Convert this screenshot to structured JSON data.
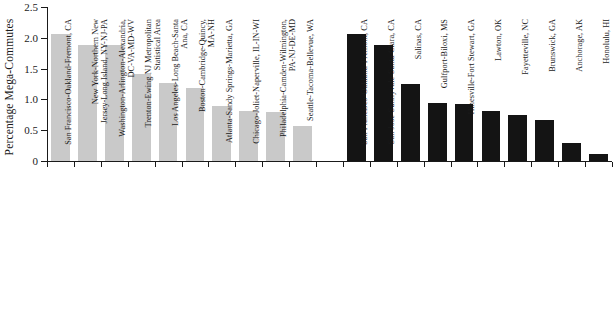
{
  "chart_data": {
    "type": "bar",
    "title": "",
    "xlabel": "",
    "ylabel": "Percentage Mega-Commutes",
    "ylim": [
      0,
      2.5
    ],
    "yticks": [
      "0",
      "0.5",
      "1.0",
      "1.5",
      "2.0",
      "2.5"
    ],
    "ytick_values": [
      0,
      0.5,
      1.0,
      1.5,
      2.0,
      2.5
    ],
    "grid": false,
    "legend": "none",
    "groups": [
      {
        "name": "largest-metros",
        "color": "#c9c9c9",
        "categories": [
          "San Francisco-Oakland-Fremont, CA",
          "New York-Northern New\nJersey-Long Island, NY-NJ-PA",
          "Washington-Arlington-Alexandria,\nDC-VA-MD-WV",
          "Trenton-Ewing NJ Metropolitan\nStatistical Area",
          "Los Angeles-Long Beach-Santa\nAna, CA",
          "Boston-Cambridge-Quincy,\nMA-NH",
          "Atlanta-Sandy Springs-Marietta, GA",
          "Chicago-Joliet-Naperville, IL-IN-WI",
          "Philadelphia-Camden-Wilmington,\nPA-NJ-DE-MD",
          "Seattle-Tacoma-Bellevue, WA"
        ],
        "values": [
          2.06,
          1.89,
          1.88,
          1.41,
          1.26,
          1.18,
          0.9,
          0.81,
          0.8,
          0.57
        ]
      },
      {
        "name": "highest-and-lowest-rates",
        "color": "#141414",
        "categories": [
          "San Francisco-Oakland-Fremont, CA",
          "San Jose-Sunnyvale-Santa Clara, CA",
          "Salinas, CA",
          "Gulfport-Biloxi, MS",
          "Hinesville-Fort Stewart, GA",
          "Lawton, OK",
          "Fayetteville, NC",
          "Brunswick, GA",
          "Anchorage, AK",
          "Honolulu, HI"
        ],
        "values": [
          2.06,
          1.89,
          1.25,
          0.94,
          0.93,
          0.82,
          0.74,
          0.66,
          0.29,
          0.12
        ]
      }
    ]
  },
  "colors": {
    "gray_bar": "#c9c9c9",
    "black_bar": "#141414",
    "axis": "#1a1a1a",
    "background": "#ffffff"
  }
}
